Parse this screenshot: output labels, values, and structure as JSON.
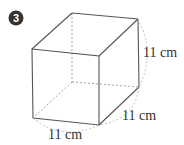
{
  "figure": {
    "problem_number": "3",
    "shape": "cube",
    "labels": {
      "height": "11 cm",
      "depth": "11 cm",
      "width": "11 cm"
    }
  },
  "colors": {
    "edge": "#555555",
    "hidden_edge": "#999999",
    "arc": "#bbbbbb",
    "badge_bg": "#333333",
    "text": "#333333"
  }
}
